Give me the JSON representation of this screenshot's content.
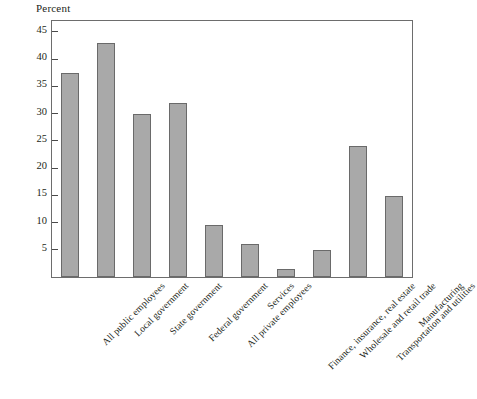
{
  "chart_data": {
    "type": "bar",
    "title": "",
    "subtitle": "",
    "xlabel": "",
    "ylabel": "Percent",
    "ylim": [
      0,
      47
    ],
    "yticks": [
      5,
      10,
      15,
      20,
      25,
      30,
      35,
      40,
      45
    ],
    "grid": false,
    "legend": null,
    "bar_color": "#a9a9a9",
    "bar_edge_color": "#6a6a6a",
    "frame_color": "#6d6d6d",
    "axis_label_rotation": -45,
    "categories": [
      "All public employees",
      "Local government",
      "State government",
      "Federal government",
      "All private employees",
      "Services",
      "Finance, insurance, real estate",
      "Wholesale and retail trade",
      "Transportation and utilities",
      "Manufacturing"
    ],
    "values": [
      37.5,
      43,
      30,
      32,
      9.5,
      6,
      1.5,
      5,
      24,
      14.8
    ]
  }
}
